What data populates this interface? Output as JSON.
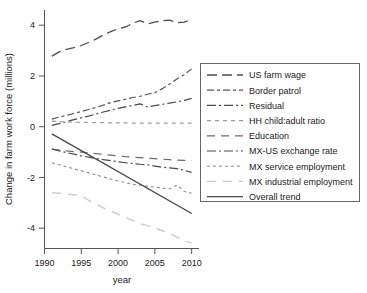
{
  "chart_data": {
    "type": "line",
    "title": "",
    "xlabel": "year",
    "ylabel": "Change in farm work force (millions)",
    "xlim": [
      1990,
      2011
    ],
    "ylim": [
      -4.8,
      4.6
    ],
    "xticks": [
      1990,
      1995,
      2000,
      2005,
      2010
    ],
    "xtick_labels": [
      "1990",
      "1995",
      "2000",
      "2005",
      "2010"
    ],
    "yticks": [
      4,
      2,
      0,
      -2,
      -4
    ],
    "ytick_labels": [
      "4",
      "2",
      "0",
      "-2",
      "-4"
    ],
    "grid": false,
    "legend_position": "right",
    "x": [
      1991,
      1992,
      1993,
      1994,
      1995,
      1996,
      1997,
      1998,
      1999,
      2000,
      2001,
      2002,
      2003,
      2004,
      2005,
      2006,
      2007,
      2008,
      2009,
      2010
    ],
    "series": [
      {
        "name": "US farm wage",
        "color": "#4d4d4d",
        "dash": "10,5",
        "width": 1.3,
        "values": [
          2.78,
          2.95,
          3.05,
          3.12,
          3.2,
          3.32,
          3.45,
          3.62,
          3.75,
          3.86,
          3.93,
          4.08,
          4.18,
          4.05,
          4.12,
          4.18,
          4.2,
          4.1,
          4.12,
          4.22
        ]
      },
      {
        "name": "Border patrol",
        "color": "#555555",
        "dash": "7,3,3,3",
        "width": 1.2,
        "values": [
          0.3,
          0.38,
          0.45,
          0.52,
          0.6,
          0.68,
          0.76,
          0.85,
          0.95,
          1.02,
          1.08,
          1.15,
          1.2,
          1.28,
          1.34,
          1.5,
          1.68,
          1.88,
          2.05,
          2.28
        ]
      },
      {
        "name": "Residual",
        "color": "#4a4a4a",
        "dash": "9,3,2,3",
        "width": 1.2,
        "values": [
          0.05,
          0.12,
          0.2,
          0.28,
          0.35,
          0.42,
          0.5,
          0.58,
          0.65,
          0.72,
          0.78,
          0.84,
          0.9,
          0.78,
          0.83,
          0.88,
          0.93,
          0.98,
          1.04,
          1.12
        ]
      },
      {
        "name": "HH child:adult ratio",
        "color": "#9a9a9a",
        "dash": "4,4",
        "width": 1.1,
        "values": [
          0.22,
          0.2,
          0.19,
          0.18,
          0.17,
          0.17,
          0.16,
          0.16,
          0.15,
          0.15,
          0.15,
          0.14,
          0.14,
          0.14,
          0.14,
          0.14,
          0.14,
          0.14,
          0.14,
          0.14
        ]
      },
      {
        "name": "Education",
        "color": "#6a6a6a",
        "dash": "8,6",
        "width": 1.2,
        "values": [
          -0.88,
          -0.92,
          -0.95,
          -0.98,
          -1.0,
          -1.03,
          -1.06,
          -1.09,
          -1.12,
          -1.15,
          -1.18,
          -1.2,
          -1.22,
          -1.24,
          -1.26,
          -1.28,
          -1.3,
          -1.32,
          -1.33,
          -1.34
        ]
      },
      {
        "name": "MX-US exchange rate",
        "color": "#4a4a4a",
        "dash": "9,3,2,3",
        "width": 1.2,
        "values": [
          -0.88,
          -0.95,
          -1.02,
          -1.08,
          -1.15,
          -1.2,
          -1.25,
          -1.3,
          -1.34,
          -1.38,
          -1.42,
          -1.45,
          -1.48,
          -1.5,
          -1.55,
          -1.6,
          -1.62,
          -1.65,
          -1.72,
          -1.8
        ]
      },
      {
        "name": "MX service employment",
        "color": "#8a8a8a",
        "dash": "3,3",
        "width": 1.1,
        "values": [
          -1.42,
          -1.5,
          -1.58,
          -1.66,
          -1.74,
          -1.82,
          -1.9,
          -1.98,
          -2.06,
          -2.14,
          -2.2,
          -2.28,
          -2.3,
          -2.35,
          -2.38,
          -2.42,
          -2.45,
          -2.3,
          -2.55,
          -2.62
        ]
      },
      {
        "name": "MX industrial employment",
        "color": "#cccccc",
        "dash": "9,7",
        "width": 1.4,
        "values": [
          -2.6,
          -2.62,
          -2.65,
          -2.68,
          -2.72,
          -2.9,
          -3.05,
          -3.2,
          -3.32,
          -3.45,
          -3.58,
          -3.7,
          -3.82,
          -3.9,
          -3.98,
          -4.1,
          -4.2,
          -4.35,
          -4.5,
          -4.58
        ]
      }
    ],
    "trend": {
      "name": "Overall trend",
      "color": "#4a4a4a",
      "dash": "none",
      "width": 1.4,
      "x": [
        1991,
        2010
      ],
      "values": [
        -0.28,
        -3.42
      ]
    }
  },
  "legend": {
    "items": [
      {
        "label": "US farm wage"
      },
      {
        "label": "Border patrol"
      },
      {
        "label": "Residual"
      },
      {
        "label": "HH child:adult ratio"
      },
      {
        "label": "Education"
      },
      {
        "label": "MX-US exchange rate"
      },
      {
        "label": "MX service employment"
      },
      {
        "label": "MX industrial employment"
      },
      {
        "label": "Overall trend"
      }
    ]
  }
}
